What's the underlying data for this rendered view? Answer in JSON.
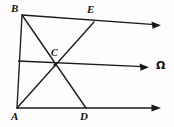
{
  "figure": {
    "background_color": "#fdfdfd",
    "stroke_color": "#1a1a1a",
    "labels": {
      "a": "A",
      "b": "B",
      "c": "C",
      "d": "D",
      "e": "E",
      "omega": "Ω"
    },
    "label_positions": {
      "a": {
        "x": 11,
        "y": 111
      },
      "b": {
        "x": 11,
        "y": 3
      },
      "c": {
        "x": 51,
        "y": 48
      },
      "d": {
        "x": 80,
        "y": 111
      },
      "e": {
        "x": 87,
        "y": 4
      },
      "omega": {
        "x": 156,
        "y": 60
      }
    },
    "points": {
      "A": {
        "x": 17,
        "y": 108
      },
      "B": {
        "x": 22,
        "y": 15
      },
      "C": {
        "x": 55,
        "y": 65
      },
      "D": {
        "x": 86,
        "y": 108
      },
      "E": {
        "x": 94,
        "y": 22
      },
      "M": {
        "x": 18,
        "y": 61
      }
    },
    "segments": [
      {
        "name": "segment-AB",
        "x1": 22,
        "y1": 15,
        "x2": 17,
        "y2": 108
      },
      {
        "name": "segment-AD",
        "x1": 17,
        "y1": 108,
        "x2": 86,
        "y2": 108
      },
      {
        "name": "segment-BD",
        "x1": 22,
        "y1": 15,
        "x2": 86,
        "y2": 108
      },
      {
        "name": "segment-AE",
        "x1": 17,
        "y1": 108,
        "x2": 94,
        "y2": 22
      },
      {
        "name": "segment-BE",
        "x1": 22,
        "y1": 15,
        "x2": 94,
        "y2": 22
      },
      {
        "name": "segment-MC",
        "x1": 18,
        "y1": 61,
        "x2": 55,
        "y2": 65
      }
    ],
    "rays": [
      {
        "name": "ray-top-from-B",
        "x1": 22,
        "y1": 15,
        "x2": 159,
        "y2": 25,
        "arrow": true
      },
      {
        "name": "ray-middle-omega",
        "x1": 18,
        "y1": 61,
        "x2": 147,
        "y2": 67,
        "arrow": true
      },
      {
        "name": "ray-bottom-from-A",
        "x1": 17,
        "y1": 108,
        "x2": 159,
        "y2": 108,
        "arrow": true
      }
    ]
  }
}
